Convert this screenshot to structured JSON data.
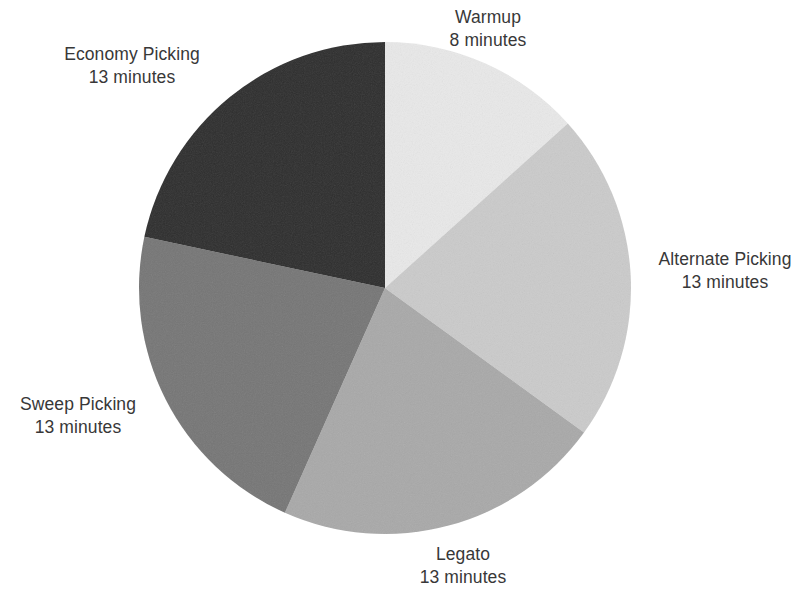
{
  "chart_data": {
    "type": "pie",
    "title": "",
    "subtitle": "",
    "xlabel": "",
    "ylabel": "",
    "unit": "minutes",
    "total_minutes": 60,
    "legend_position": "none",
    "grid": false,
    "start_angle_deg": 0,
    "direction": "clockwise",
    "categories": [
      "Warmup",
      "Alternate Picking",
      "Legato",
      "Sweep Picking",
      "Economy Picking"
    ],
    "values": [
      8,
      13,
      13,
      13,
      13
    ],
    "colors": [
      "#e9e9e9",
      "#cbcbcb",
      "#a9a9a9",
      "#767676",
      "#2e2e2e"
    ],
    "slices": [
      {
        "name": "Warmup",
        "value": 8,
        "value_label": "8 minutes",
        "color": "#e9e9e9",
        "start_deg": 0,
        "end_deg": 48
      },
      {
        "name": "Alternate Picking",
        "value": 13,
        "value_label": "13 minutes",
        "color": "#cbcbcb",
        "start_deg": 48,
        "end_deg": 126
      },
      {
        "name": "Legato",
        "value": 13,
        "value_label": "13 minutes",
        "color": "#a9a9a9",
        "start_deg": 126,
        "end_deg": 204
      },
      {
        "name": "Sweep Picking",
        "value": 13,
        "value_label": "13 minutes",
        "color": "#767676",
        "start_deg": 204,
        "end_deg": 282
      },
      {
        "name": "Economy Picking",
        "value": 13,
        "value_label": "13 minutes",
        "color": "#2e2e2e",
        "start_deg": 282,
        "end_deg": 360
      }
    ]
  },
  "labels": {
    "warmup": {
      "name": "Warmup",
      "value": "8 minutes"
    },
    "alternate_picking": {
      "name": "Alternate Picking",
      "value": "13 minutes"
    },
    "legato": {
      "name": "Legato",
      "value": "13 minutes"
    },
    "sweep_picking": {
      "name": "Sweep Picking",
      "value": "13 minutes"
    },
    "economy_picking": {
      "name": "Economy Picking",
      "value": "13 minutes"
    }
  },
  "style": {
    "background": "#ffffff",
    "text_color": "#383838",
    "center_x": 385,
    "center_y": 288,
    "radius": 246
  }
}
